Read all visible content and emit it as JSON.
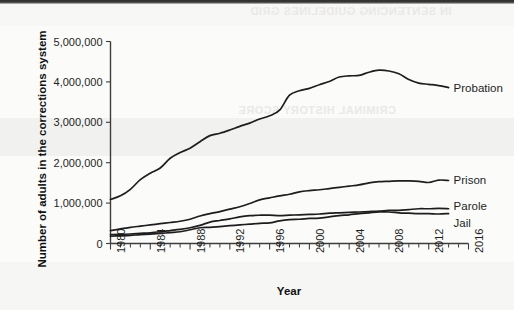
{
  "chart_data": {
    "type": "line",
    "title": "",
    "xlabel": "Year",
    "ylabel": "Number of adults in the corrections system",
    "xlim": [
      1980,
      2016
    ],
    "ylim": [
      0,
      5000000
    ],
    "grid": false,
    "legend_position": "right-of-line-ends",
    "xticks": [
      1980,
      1984,
      1988,
      1992,
      1996,
      2000,
      2004,
      2008,
      2012,
      2016
    ],
    "xtick_labels": [
      "1980",
      "1984",
      "1988",
      "1992",
      "1996",
      "2000",
      "2004",
      "2008",
      "2012",
      "2016"
    ],
    "x_minor_tick_step": 1,
    "yticks": [
      0,
      1000000,
      2000000,
      3000000,
      4000000,
      5000000
    ],
    "ytick_labels": [
      "0",
      "1,000,000",
      "2,000,000",
      "3,000,000",
      "4,000,000",
      "5,000,000"
    ],
    "x": [
      1980,
      1981,
      1982,
      1983,
      1984,
      1985,
      1986,
      1987,
      1988,
      1989,
      1990,
      1991,
      1992,
      1993,
      1994,
      1995,
      1996,
      1997,
      1998,
      1999,
      2000,
      2001,
      2002,
      2003,
      2004,
      2005,
      2006,
      2007,
      2008,
      2009,
      2010,
      2011,
      2012,
      2013,
      2014
    ],
    "series": [
      {
        "name": "Probation",
        "color": "#1d1d1d",
        "values": [
          1090000,
          1180000,
          1340000,
          1580000,
          1740000,
          1870000,
          2110000,
          2250000,
          2360000,
          2520000,
          2670000,
          2730000,
          2810000,
          2900000,
          2980000,
          3080000,
          3160000,
          3300000,
          3670000,
          3780000,
          3840000,
          3930000,
          4010000,
          4120000,
          4150000,
          4160000,
          4240000,
          4290000,
          4270000,
          4200000,
          4060000,
          3970000,
          3940000,
          3910000,
          3860000
        ]
      },
      {
        "name": "Prison",
        "color": "#1d1d1d",
        "values": [
          320000,
          360000,
          400000,
          430000,
          460000,
          490000,
          520000,
          550000,
          600000,
          680000,
          740000,
          790000,
          850000,
          910000,
          990000,
          1080000,
          1130000,
          1180000,
          1220000,
          1280000,
          1310000,
          1330000,
          1360000,
          1390000,
          1420000,
          1450000,
          1500000,
          1530000,
          1540000,
          1550000,
          1550000,
          1540000,
          1510000,
          1570000,
          1560000
        ]
      },
      {
        "name": "Parole",
        "color": "#1d1d1d",
        "values": [
          220000,
          225000,
          235000,
          250000,
          265000,
          290000,
          320000,
          350000,
          390000,
          450000,
          530000,
          570000,
          610000,
          660000,
          690000,
          700000,
          700000,
          690000,
          700000,
          710000,
          720000,
          730000,
          750000,
          760000,
          770000,
          780000,
          790000,
          800000,
          820000,
          820000,
          840000,
          860000,
          860000,
          870000,
          860000
        ]
      },
      {
        "name": "Jail",
        "color": "#1d1d1d",
        "values": [
          180000,
          190000,
          200000,
          220000,
          230000,
          250000,
          270000,
          290000,
          340000,
          390000,
          400000,
          420000,
          440000,
          460000,
          480000,
          500000,
          510000,
          560000,
          590000,
          600000,
          620000,
          630000,
          660000,
          690000,
          710000,
          740000,
          760000,
          780000,
          780000,
          760000,
          750000,
          740000,
          740000,
          730000,
          740000
        ]
      }
    ],
    "annotations": [
      "Probation rises steeply from 1980 to a peak near 2008 then declines",
      "Prison rises steadily and plateaus after about 2008",
      "Parole crosses above Jail around 2010"
    ]
  },
  "background_bleed": {
    "line_1": "IN SENTENCING GUIDELINES GRID",
    "line_2": "CRIMINAL HISTORY SCORE"
  }
}
